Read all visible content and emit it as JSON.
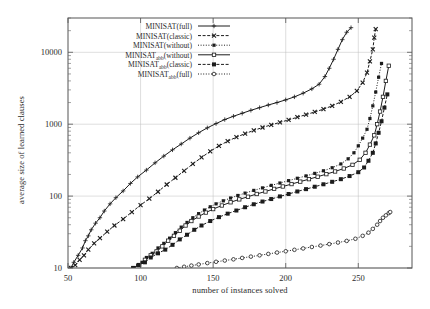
{
  "chart_data": {
    "type": "line",
    "title": "",
    "xlabel": "number of instances solved",
    "ylabel": "average size of learned clauses",
    "xlim": [
      50,
      287
    ],
    "ylim": [
      10,
      30000
    ],
    "yscale": "log",
    "xticks": [
      50,
      100,
      150,
      200,
      250
    ],
    "yticks": [
      10,
      100,
      1000,
      10000
    ],
    "ytick_labels": [
      "10",
      "100",
      "1000",
      "10000"
    ],
    "grid": true,
    "legend_position": "top-center",
    "series": [
      {
        "name": "MINISAT(full)",
        "marker": "plus",
        "linestyle": "solid",
        "x": [
          52,
          54,
          57,
          60,
          62,
          64,
          66,
          69,
          72,
          75,
          79,
          83,
          88,
          93,
          98,
          104,
          110,
          116,
          122,
          128,
          134,
          140,
          146,
          152,
          158,
          164,
          170,
          176,
          182,
          188,
          194,
          200,
          206,
          212,
          218,
          223,
          227,
          230,
          233,
          236,
          239,
          242,
          245
        ],
        "y": [
          10,
          12,
          15,
          19,
          24,
          28,
          34,
          42,
          50,
          62,
          78,
          95,
          118,
          150,
          185,
          230,
          290,
          360,
          440,
          530,
          640,
          760,
          890,
          1020,
          1160,
          1290,
          1420,
          1560,
          1700,
          1850,
          2000,
          2180,
          2400,
          2700,
          3100,
          3600,
          4600,
          6000,
          8000,
          11000,
          15000,
          19000,
          22000
        ]
      },
      {
        "name": "MINISAT(classic)",
        "marker": "filled-x",
        "linestyle": "dashed",
        "x": [
          52,
          55,
          58,
          61,
          64,
          68,
          72,
          77,
          82,
          88,
          94,
          100,
          106,
          112,
          118,
          124,
          130,
          136,
          142,
          148,
          154,
          160,
          166,
          172,
          178,
          184,
          190,
          196,
          202,
          208,
          214,
          220,
          226,
          232,
          238,
          244,
          249,
          253,
          256,
          258,
          260,
          261,
          262
        ],
        "y": [
          10,
          11,
          13,
          15,
          18,
          22,
          26,
          32,
          39,
          48,
          60,
          75,
          92,
          115,
          145,
          180,
          225,
          280,
          345,
          420,
          500,
          580,
          660,
          740,
          820,
          900,
          980,
          1060,
          1150,
          1250,
          1360,
          1480,
          1620,
          1800,
          2050,
          2400,
          2900,
          3800,
          5200,
          7500,
          11000,
          16000,
          21000
        ]
      },
      {
        "name": "MINISAT(without)",
        "marker": "filled-square-small",
        "linestyle": "dotted",
        "x": [
          95,
          98,
          101,
          104,
          108,
          112,
          116,
          120,
          124,
          128,
          132,
          136,
          140,
          144,
          148,
          152,
          157,
          162,
          167,
          172,
          178,
          184,
          190,
          196,
          202,
          208,
          214,
          220,
          226,
          232,
          238,
          243,
          247,
          250,
          253,
          256,
          258,
          260,
          262,
          264,
          266
        ],
        "y": [
          10,
          11,
          12,
          14,
          16,
          19,
          22,
          26,
          31,
          37,
          43,
          50,
          57,
          64,
          71,
          78,
          86,
          94,
          102,
          110,
          120,
          130,
          141,
          152,
          164,
          177,
          191,
          207,
          225,
          248,
          280,
          330,
          400,
          500,
          640,
          850,
          1200,
          1800,
          2800,
          4500,
          7000
        ]
      },
      {
        "name": "MINISAT_abb(without)",
        "marker": "open-square",
        "linestyle": "solid",
        "x": [
          95,
          99,
          103,
          107,
          111,
          115,
          119,
          123,
          127,
          131,
          135,
          140,
          145,
          150,
          156,
          162,
          168,
          174,
          180,
          186,
          192,
          198,
          204,
          210,
          216,
          222,
          228,
          234,
          240,
          246,
          251,
          255,
          258,
          261,
          263,
          265,
          267,
          269,
          271
        ],
        "y": [
          10,
          11,
          13,
          15,
          17,
          20,
          24,
          28,
          33,
          39,
          45,
          52,
          59,
          66,
          74,
          82,
          90,
          98,
          107,
          116,
          126,
          136,
          147,
          159,
          172,
          186,
          202,
          220,
          242,
          272,
          320,
          400,
          520,
          700,
          1000,
          1500,
          2400,
          4000,
          6500
        ]
      },
      {
        "name": "MINISAT_abb(classic)",
        "marker": "filled-square",
        "linestyle": "dashed",
        "x": [
          95,
          99,
          103,
          107,
          112,
          117,
          122,
          127,
          132,
          137,
          142,
          148,
          154,
          160,
          166,
          172,
          178,
          184,
          190,
          196,
          202,
          208,
          214,
          220,
          226,
          232,
          238,
          244,
          250,
          254,
          257,
          260,
          262,
          264,
          266,
          268,
          270
        ],
        "y": [
          10,
          11,
          12,
          14,
          16,
          18,
          21,
          25,
          29,
          34,
          39,
          45,
          51,
          57,
          63,
          70,
          77,
          84,
          91,
          99,
          107,
          116,
          125,
          135,
          146,
          158,
          172,
          190,
          215,
          250,
          310,
          400,
          540,
          760,
          1100,
          1700,
          2600
        ]
      },
      {
        "name": "MINISAT_abb(full)",
        "marker": "open-circle",
        "linestyle": "dotted",
        "x": [
          125,
          130,
          135,
          140,
          146,
          152,
          158,
          164,
          170,
          176,
          182,
          188,
          194,
          200,
          206,
          212,
          218,
          224,
          230,
          236,
          242,
          248,
          253,
          257,
          260,
          263,
          265,
          267,
          269,
          271,
          272
        ],
        "y": [
          10,
          10.4,
          10.8,
          11.2,
          11.7,
          12.2,
          12.7,
          13.2,
          13.8,
          14.4,
          15.0,
          15.7,
          16.4,
          17.1,
          17.9,
          18.7,
          19.6,
          20.5,
          21.5,
          22.6,
          23.8,
          25.5,
          28,
          31,
          35,
          40,
          45,
          50,
          54,
          58,
          60
        ]
      }
    ]
  },
  "legend": {
    "entries": [
      {
        "label": "MINISAT(full)",
        "base": "MINISAT",
        "sub": "",
        "suffix": "(full)"
      },
      {
        "label": "MINISAT(classic)",
        "base": "MINISAT",
        "sub": "",
        "suffix": "(classic)"
      },
      {
        "label": "MINISAT(without)",
        "base": "MINISAT",
        "sub": "",
        "suffix": "(without)"
      },
      {
        "label": "MINISAT_abb(without)",
        "base": "MINISAT",
        "sub": "abb",
        "suffix": "(without)"
      },
      {
        "label": "MINISAT_abb(classic)",
        "base": "MINISAT",
        "sub": "abb",
        "suffix": "(classic)"
      },
      {
        "label": "MINISAT_abb(full)",
        "base": "MINISAT",
        "sub": "abb",
        "suffix": "(full)"
      }
    ]
  },
  "colors": {
    "ink": "#1c1c1c",
    "frame": "#555555",
    "grid": "#bdbdbd",
    "background": "#ffffff"
  }
}
